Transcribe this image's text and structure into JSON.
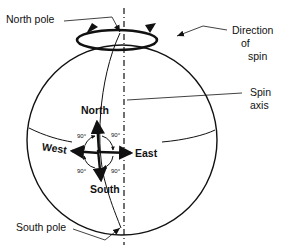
{
  "diagram": {
    "colors": {
      "ink": "#111111",
      "background": "#ffffff"
    },
    "labels": {
      "north_pole": "North pole",
      "south_pole": "South pole",
      "direction_of_spin_line1": "Direction",
      "direction_of_spin_line2": "of",
      "direction_of_spin_line3": "spin",
      "spin_axis_line1": "Spin",
      "spin_axis_line2": "axis"
    },
    "compass": {
      "north": "North",
      "south": "South",
      "east": "East",
      "west": "West",
      "angles": [
        "90°",
        "90°",
        "90°",
        "90°"
      ]
    }
  }
}
